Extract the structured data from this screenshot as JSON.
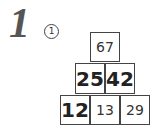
{
  "problem": {
    "number": "1",
    "sub_label": "1"
  },
  "pyramid": {
    "top": {
      "value": "67",
      "type": "answer"
    },
    "middle": [
      {
        "value": "25",
        "type": "given"
      },
      {
        "value": "42",
        "type": "given"
      }
    ],
    "bottom": [
      {
        "value": "12",
        "type": "given"
      },
      {
        "value": "13",
        "type": "answer"
      },
      {
        "value": "29",
        "type": "answer"
      }
    ]
  }
}
